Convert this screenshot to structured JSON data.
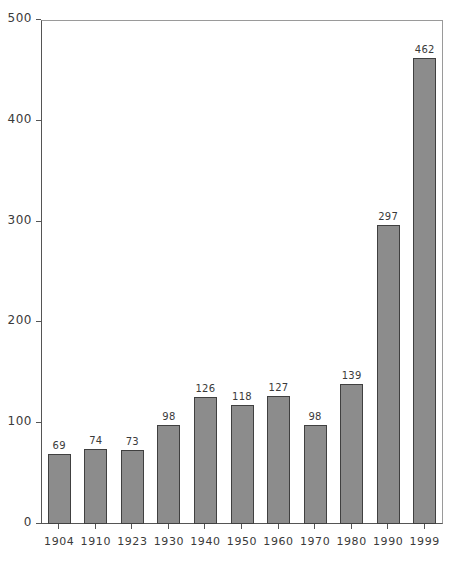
{
  "chart_data": {
    "type": "bar",
    "title": "",
    "subtitle": "",
    "xlabel": "",
    "ylabel": "",
    "categories": [
      "1904",
      "1910",
      "1923",
      "1930",
      "1940",
      "1950",
      "1960",
      "1970",
      "1980",
      "1990",
      "1999"
    ],
    "values": [
      69,
      74,
      73,
      98,
      126,
      118,
      127,
      98,
      139,
      297,
      462
    ],
    "data_labels": [
      "69",
      "74",
      "73",
      "98",
      "126",
      "118",
      "127",
      "98",
      "139",
      "297",
      "462"
    ],
    "ylim": [
      0,
      500
    ],
    "yticks": [
      0,
      100,
      200,
      300,
      400,
      500
    ],
    "ytick_labels": [
      "0",
      "100",
      "200",
      "300",
      "400",
      "500"
    ],
    "grid": false,
    "legend": null,
    "bar_color": "#8c8c8c",
    "bar_border_color": "#404040",
    "axis_color": "#555555",
    "frame_color": "#9a9a9a",
    "text_color": "#3a3a3a",
    "background": "#ffffff"
  }
}
